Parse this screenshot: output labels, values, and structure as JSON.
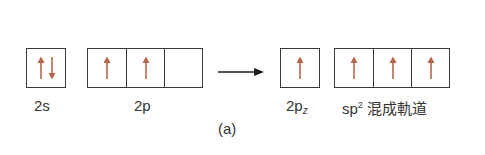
{
  "figure": {
    "caption": "(a)",
    "colors": {
      "electron_arrow": "#b5654a",
      "box_border": "#3a3a3a",
      "transition_arrow": "#1a1a1a"
    },
    "before": [
      {
        "id": "2s",
        "label": "2s",
        "cells": [
          [
            "up",
            "down"
          ]
        ]
      },
      {
        "id": "2p",
        "label": "2p",
        "cells": [
          [
            "up"
          ],
          [
            "up"
          ],
          []
        ]
      }
    ],
    "after": [
      {
        "id": "2pz",
        "label_main": "2p",
        "label_sub": "z",
        "cells": [
          [
            "up"
          ]
        ]
      },
      {
        "id": "sp2",
        "label_main": "sp",
        "label_sup": "2",
        "label_suffix": " 混成軌道",
        "cells": [
          [
            "up"
          ],
          [
            "up"
          ],
          [
            "up"
          ]
        ]
      }
    ],
    "transition_arrow": "right-arrow"
  }
}
